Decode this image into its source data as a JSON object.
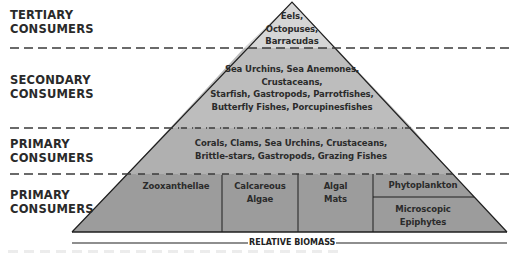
{
  "diagram": {
    "axis_label": "RELATIVE BIOMASS",
    "colors": {
      "tertiary_fill": "#d6d6d6",
      "secondary_fill": "#bdbdbd",
      "primary_fill": "#b0b0b0",
      "producer_fill": "#9a9a9a",
      "outline": "#1e1e1e",
      "dash": "#3a3a3a",
      "label_text": "#2a2a2a"
    },
    "levels": [
      {
        "label_line1": "TERTIARY",
        "label_line2": "CONSUMERS",
        "organisms": [
          "Eels,",
          "Octopuses,",
          "Barracudas"
        ]
      },
      {
        "label_line1": "SECONDARY",
        "label_line2": "CONSUMERS",
        "organisms": [
          "Sea Urchins, Sea Anemones,",
          "Crustaceans,",
          "Starfish, Gastropods, Parrotfishes,",
          "Butterfly Fishes, Porcupinesfishes"
        ]
      },
      {
        "label_line1": "PRIMARY",
        "label_line2": "CONSUMERS",
        "organisms": [
          "Corals, Clams, Sea Urchins, Crustaceans,",
          "Brittle-stars, Gastropods, Grazing Fishes"
        ]
      },
      {
        "label_line1": "PRIMARY",
        "label_line2": "CONSUMERS",
        "compartments": [
          {
            "lines": [
              "Zooxanthellae"
            ]
          },
          {
            "lines": [
              "Calcareous",
              "Algae"
            ]
          },
          {
            "lines": [
              "Algal",
              "Mats"
            ]
          },
          {
            "lines": [
              "Phytoplankton"
            ]
          },
          {
            "lines": [
              "Microscopic",
              "Epiphytes"
            ]
          }
        ]
      }
    ]
  }
}
